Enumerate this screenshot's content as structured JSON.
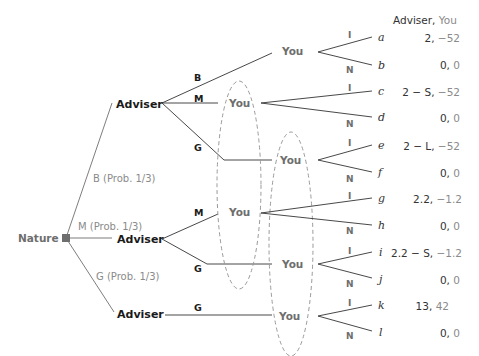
{
  "header": {
    "payoff_header_adviser": "Adviser,",
    "payoff_header_you": " You"
  },
  "nature": {
    "label": "Nature",
    "branches": [
      {
        "label": "B (Prob. 1/3)"
      },
      {
        "label": "M (Prob. 1/3)"
      },
      {
        "label": "G (Prob. 1/3)"
      }
    ]
  },
  "advisers": [
    {
      "label": "Adviser",
      "actions": [
        "B",
        "M",
        "G"
      ]
    },
    {
      "label": "Adviser",
      "actions": [
        "M",
        "G"
      ]
    },
    {
      "label": "Adviser",
      "actions": [
        "G"
      ]
    }
  ],
  "you_nodes": [
    {
      "label": "You"
    },
    {
      "label": "You"
    },
    {
      "label": "You"
    },
    {
      "label": "You"
    },
    {
      "label": "You"
    },
    {
      "label": "You"
    }
  ],
  "actions": {
    "invest": "I",
    "not_invest": "N"
  },
  "terminals": [
    {
      "id": "a",
      "adviser": "2,",
      "you": " −52"
    },
    {
      "id": "b",
      "adviser": "0,",
      "you": " 0"
    },
    {
      "id": "c",
      "adviser": "2 − S,",
      "you": " −52"
    },
    {
      "id": "d",
      "adviser": "0,",
      "you": " 0"
    },
    {
      "id": "e",
      "adviser": "2 − L,",
      "you": " −52"
    },
    {
      "id": "f",
      "adviser": "0,",
      "you": " 0"
    },
    {
      "id": "g",
      "adviser": "2.2,",
      "you": " −1.2"
    },
    {
      "id": "h",
      "adviser": "0,",
      "you": " 0"
    },
    {
      "id": "i",
      "adviser": "2.2 − S,",
      "you": " −1.2"
    },
    {
      "id": "j",
      "adviser": "0,",
      "you": " 0"
    },
    {
      "id": "k",
      "adviser": "13,",
      "you": " 42"
    },
    {
      "id": "l",
      "adviser": "0,",
      "you": " 0"
    }
  ],
  "colors": {
    "edge": "#333333",
    "grey_text": "#6e6e6e",
    "prob_text": "#8a8a8a",
    "infoset_dash": "#9a9a9a"
  }
}
